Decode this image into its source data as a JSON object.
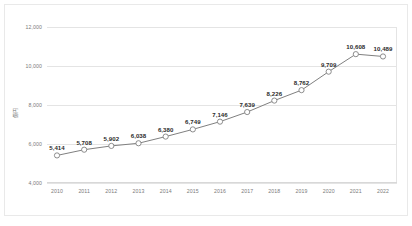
{
  "chart_data": {
    "type": "line",
    "title": "",
    "xlabel": "",
    "ylabel": "億円",
    "categories": [
      "2010",
      "2011",
      "2012",
      "2013",
      "2014",
      "2015",
      "2016",
      "2017",
      "2018",
      "2019",
      "2020",
      "2021",
      "2022"
    ],
    "values": [
      5414,
      5708,
      5902,
      6038,
      6380,
      6749,
      7146,
      7639,
      8226,
      8762,
      9709,
      10608,
      10489
    ],
    "value_labels": [
      "5,414",
      "5,708",
      "5,902",
      "6,038",
      "6,380",
      "6,749",
      "7,146",
      "7,639",
      "8,226",
      "8,762",
      "9,709",
      "10,608",
      "10,489"
    ],
    "ylim": [
      4000,
      12000
    ],
    "yticks": [
      4000,
      6000,
      8000,
      10000,
      12000
    ],
    "ytick_labels": [
      "4,000",
      "6,000",
      "8,000",
      "10,000",
      "12,000"
    ],
    "grid": true,
    "legend": "none",
    "series_color": "#808080",
    "marker": "open-circle",
    "marker_fill": "#ffffff",
    "grid_color": "#e4e4e4",
    "background": "#ffffff"
  }
}
